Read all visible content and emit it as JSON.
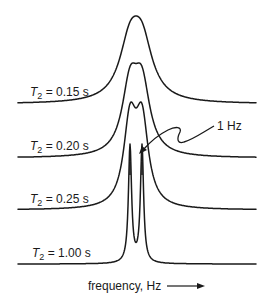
{
  "figure": {
    "title": "",
    "spectra": [
      {
        "id": "t2-015",
        "label_var": "T",
        "label_sub": "2",
        "label_rest": " = 0.15 s",
        "t2_seconds": 0.15,
        "shape": "single-broad"
      },
      {
        "id": "t2-020",
        "label_var": "T",
        "label_sub": "2",
        "label_rest": " = 0.20 s",
        "t2_seconds": 0.2,
        "shape": "flat-top"
      },
      {
        "id": "t2-025",
        "label_var": "T",
        "label_sub": "2",
        "label_rest": " = 0.25 s",
        "t2_seconds": 0.25,
        "shape": "partially-resolved-doublet"
      },
      {
        "id": "t2-100",
        "label_var": "T",
        "label_sub": "2",
        "label_rest": " = 1.00 s",
        "t2_seconds": 1.0,
        "shape": "resolved-doublet"
      }
    ],
    "doublet_splitting_hz": 1,
    "annotation": {
      "text": "1 Hz"
    },
    "x_axis": {
      "label": "frequency, Hz",
      "arrow": "right-arrow-icon"
    },
    "colors": {
      "ink": "#1a1a1a",
      "background": "#ffffff"
    }
  }
}
